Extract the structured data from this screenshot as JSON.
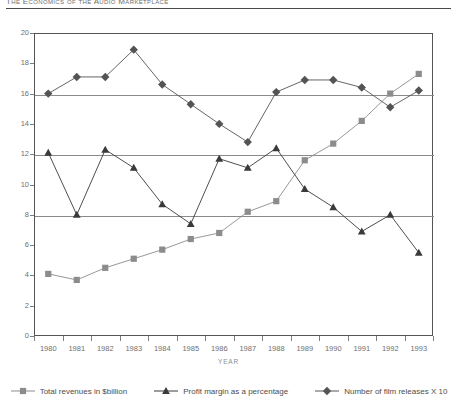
{
  "running_head": {
    "text": "The Economics of the Audio Marketplace"
  },
  "chart_data": {
    "type": "line",
    "title": "",
    "xlabel": "YEAR",
    "ylabel": "",
    "x": [
      1980,
      1981,
      1982,
      1983,
      1984,
      1985,
      1986,
      1987,
      1988,
      1989,
      1990,
      1991,
      1992,
      1993
    ],
    "xtick_labels": [
      "1980",
      "1981",
      "1982",
      "1983",
      "1984",
      "1985",
      "1986",
      "1987",
      "1988",
      "1989",
      "1990",
      "1991",
      "1992",
      "1993"
    ],
    "ylim": [
      0,
      20
    ],
    "ytick_values": [
      0,
      2,
      4,
      6,
      8,
      10,
      12,
      14,
      16,
      18,
      20
    ],
    "ytick_labels": [
      "0",
      "2",
      "4",
      "6",
      "8",
      "10",
      "12",
      "14",
      "16",
      "18",
      "20"
    ],
    "gridlines_at": [
      8,
      12,
      16
    ],
    "grid": true,
    "legend_position": "bottom",
    "series": [
      {
        "name": "Total revenues in $billion",
        "marker": "square",
        "color": "#8c8c8c",
        "values": [
          4.1,
          3.7,
          4.5,
          5.1,
          5.7,
          6.4,
          6.8,
          8.2,
          8.9,
          11.6,
          12.7,
          14.2,
          16.0,
          17.3
        ]
      },
      {
        "name": "Profit margin as a percentage",
        "marker": "triangle",
        "color": "#3a3a3a",
        "values": [
          12.1,
          8.0,
          12.3,
          11.1,
          8.7,
          7.4,
          11.7,
          11.1,
          12.4,
          9.7,
          8.5,
          6.9,
          8.0,
          5.5
        ]
      },
      {
        "name": "Number of film releases X 10",
        "marker": "diamond",
        "color": "#545454",
        "values": [
          16.0,
          17.1,
          17.1,
          18.9,
          16.6,
          15.3,
          14.0,
          12.8,
          16.1,
          16.9,
          16.9,
          16.4,
          15.1,
          16.2
        ]
      }
    ]
  }
}
